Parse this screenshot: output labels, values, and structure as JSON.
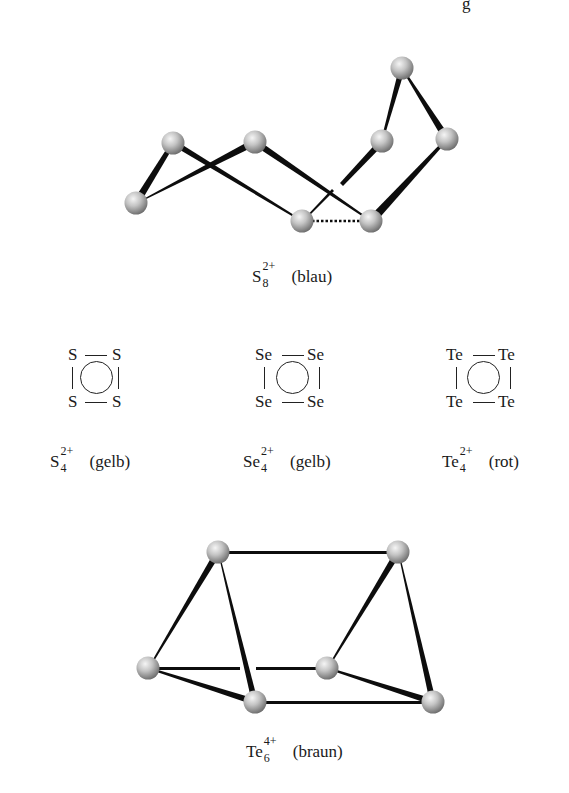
{
  "header_fragment": "g",
  "s8": {
    "formula_base": "S",
    "formula_sub": "8",
    "formula_sup": "2+",
    "color": "(blau)"
  },
  "rings": [
    {
      "atoms": [
        "S",
        "S",
        "S",
        "S"
      ],
      "formula_base": "S",
      "formula_sub": "4",
      "formula_sup": "2+",
      "color": "(gelb)"
    },
    {
      "atoms": [
        "Se",
        "Se",
        "Se",
        "Se"
      ],
      "formula_base": "Se",
      "formula_sub": "4",
      "formula_sup": "2+",
      "color": "(gelb)"
    },
    {
      "atoms": [
        "Te",
        "Te",
        "Te",
        "Te"
      ],
      "formula_base": "Te",
      "formula_sub": "4",
      "formula_sup": "2+",
      "color": "(rot)"
    }
  ],
  "te6": {
    "formula_base": "Te",
    "formula_sub": "6",
    "formula_sup": "4+",
    "color": "(braun)"
  },
  "colors": {
    "bond": "#0d0d0d",
    "atom_light": "#f2f2f2",
    "atom_dark": "#7a7a7a",
    "text": "#1a1a1a"
  }
}
